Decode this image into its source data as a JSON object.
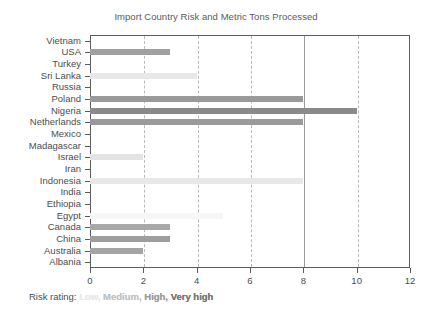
{
  "chart_data": {
    "type": "bar",
    "orientation": "horizontal",
    "title": "Import Country Risk and Metric Tons Processed",
    "xlabel": "",
    "ylabel": "",
    "xlim": [
      0,
      12
    ],
    "xticks": [
      0,
      2,
      4,
      6,
      8,
      10,
      12
    ],
    "xtick_labels": [
      "0",
      "2",
      "4",
      "6",
      "8",
      "10",
      "12"
    ],
    "grid": "vertical",
    "legend_position": "below-axis",
    "categories": [
      "Vietnam",
      "USA",
      "Turkey",
      "Sri Lanka",
      "Russia",
      "Poland",
      "Nigeria",
      "Netherlands",
      "Mexico",
      "Madagascar",
      "Israel",
      "Iran",
      "Indonesia",
      "India",
      "Ethiopia",
      "Egypt",
      "Canada",
      "China",
      "Australia",
      "Albania"
    ],
    "values": [
      0,
      3,
      0,
      4,
      0,
      8,
      10,
      8,
      0,
      0,
      2,
      0,
      8,
      0,
      0,
      5,
      3,
      3,
      2,
      0
    ],
    "risk_levels": [
      "",
      "High",
      "",
      "Low",
      "",
      "High",
      "Very high",
      "High",
      "",
      "",
      "Low",
      "",
      "Low",
      "",
      "",
      "Low",
      "High",
      "High",
      "High",
      ""
    ],
    "bar_colors": [
      "#ffffff",
      "#a0a0a0",
      "#ffffff",
      "#e8e8e8",
      "#ffffff",
      "#9a9a9a",
      "#8a8a8a",
      "#9a9a9a",
      "#ffffff",
      "#ffffff",
      "#e4e4e4",
      "#ffffff",
      "#e8e8e8",
      "#ffffff",
      "#ffffff",
      "#f7f7f7",
      "#a8a8a8",
      "#9e9e9e",
      "#a4a4a4",
      "#ffffff"
    ],
    "series": [
      {
        "name": "Metric Tons Processed",
        "values": [
          0,
          3,
          0,
          4,
          0,
          8,
          10,
          8,
          0,
          0,
          2,
          0,
          8,
          0,
          0,
          5,
          3,
          3,
          2,
          0
        ]
      }
    ]
  },
  "caption": {
    "lead": "Risk rating:",
    "swatches": [
      {
        "label": "Low,",
        "color": "#e8e8e8"
      },
      {
        "label": "Medium,",
        "color": "#c4c4c4"
      },
      {
        "label": "High,",
        "color": "#9e9e9e"
      },
      {
        "label": "Very high",
        "color": "#7a7a7a"
      }
    ]
  },
  "colors": {
    "axis": "#5c5c5c",
    "gridline": "#b9b9b9",
    "text": "#4d4d4d",
    "title": "#5a5a5a",
    "background": "#ffffff"
  }
}
